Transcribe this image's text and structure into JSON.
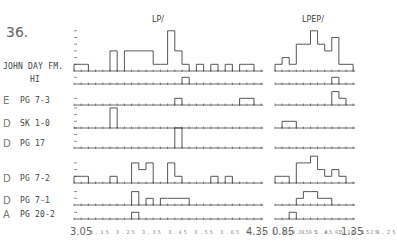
{
  "figure_number": "36.",
  "chart_data": {
    "type": "bar",
    "title": "",
    "panels": [
      {
        "name": "LP/",
        "xlabel": "LP/",
        "bin_start": 3.05,
        "bin_width": 0.05,
        "bins": 26,
        "tick_labels": [
          "3.05",
          "3.15",
          "3.25",
          "3.35",
          "3.45",
          "3.55",
          "3.65",
          "3.75",
          "3.85",
          "3.95",
          "4.05",
          "4.15",
          "4.25",
          "4.35"
        ],
        "xlim": [
          3.05,
          4.35
        ]
      },
      {
        "name": "LPEP/",
        "xlabel": "LPEP/",
        "bin_start": 0.85,
        "bin_width": 0.05,
        "bins": 11,
        "tick_labels": [
          "0.85",
          "0.95",
          "1.05",
          "1.15",
          "1.25",
          "1.35"
        ],
        "xlim": [
          0.85,
          1.35
        ]
      }
    ],
    "series": [
      {
        "group": "",
        "name": "JOHN DAY FM.",
        "LP": [
          1,
          1,
          0,
          0,
          0,
          3,
          0,
          3,
          3,
          3,
          3,
          1,
          1,
          6,
          3,
          1,
          0,
          1,
          0,
          1,
          0,
          1,
          0,
          1,
          1,
          0
        ],
        "LPEP": [
          1,
          2,
          1,
          4,
          4,
          6,
          4,
          3,
          5,
          1,
          1
        ]
      },
      {
        "group": "",
        "name": "HI",
        "LP": [
          0,
          0,
          0,
          0,
          0,
          0,
          0,
          0,
          0,
          0,
          0,
          0,
          0,
          0,
          0,
          1,
          0,
          0,
          0,
          0,
          0,
          0,
          0,
          0,
          0,
          0
        ],
        "LPEP": [
          0,
          0,
          0,
          0,
          0,
          0,
          0,
          0,
          1,
          0,
          0
        ]
      },
      {
        "group": "E",
        "name": "PG 7-3",
        "LP": [
          0,
          0,
          0,
          0,
          0,
          0,
          0,
          0,
          0,
          0,
          0,
          0,
          0,
          0,
          1,
          0,
          0,
          0,
          0,
          0,
          0,
          0,
          0,
          1,
          1,
          0
        ],
        "LPEP": [
          0,
          0,
          0,
          0,
          0,
          0,
          0,
          0,
          2,
          1,
          0
        ]
      },
      {
        "group": "D",
        "name": "SK 1-0",
        "LP": [
          0,
          0,
          0,
          0,
          0,
          3,
          0,
          0,
          0,
          0,
          0,
          0,
          0,
          0,
          0,
          0,
          0,
          0,
          0,
          0,
          0,
          0,
          0,
          0,
          0,
          0
        ],
        "LPEP": [
          0,
          1,
          1,
          0,
          0,
          0,
          0,
          0,
          0,
          0,
          0
        ]
      },
      {
        "group": "D",
        "name": "PG 17",
        "LP": [
          0,
          0,
          0,
          0,
          0,
          0,
          0,
          0,
          0,
          0,
          0,
          0,
          0,
          0,
          3,
          0,
          0,
          0,
          0,
          0,
          0,
          0,
          0,
          0,
          0,
          0
        ],
        "LPEP": [
          0,
          0,
          0,
          0,
          0,
          0,
          0,
          0,
          0,
          0,
          0
        ]
      },
      {
        "group": "D",
        "name": "PG 7-2",
        "LP": [
          1,
          1,
          0,
          0,
          0,
          1,
          0,
          0,
          3,
          2,
          3,
          0,
          0,
          3,
          1,
          0,
          0,
          0,
          0,
          1,
          0,
          1,
          0,
          0,
          0,
          0
        ],
        "LPEP": [
          1,
          1,
          0,
          3,
          3,
          4,
          2,
          1,
          2,
          1,
          0
        ]
      },
      {
        "group": "D",
        "name": "PG 7-1",
        "LP": [
          0,
          0,
          0,
          0,
          0,
          0,
          0,
          0,
          2,
          0,
          1,
          0,
          1,
          1,
          1,
          1,
          0,
          0,
          0,
          0,
          0,
          0,
          0,
          0,
          0,
          0
        ],
        "LPEP": [
          0,
          0,
          0,
          1,
          2,
          2,
          1,
          1,
          0,
          0,
          0
        ]
      },
      {
        "group": "A",
        "name": "PG 20-2",
        "LP": [
          0,
          0,
          0,
          0,
          0,
          0,
          0,
          0,
          1,
          0,
          0,
          0,
          0,
          0,
          0,
          0,
          0,
          0,
          0,
          0,
          0,
          0,
          0,
          0,
          0,
          0
        ],
        "LPEP": [
          0,
          0,
          1,
          0,
          0,
          0,
          0,
          0,
          0,
          0,
          0
        ]
      }
    ],
    "grid": false,
    "legend": "none"
  },
  "labels": {
    "fig": "36.",
    "lp_title": "LP/",
    "lpep_title": "LPEP/",
    "rows": [
      {
        "group": "",
        "name": "JOHN DAY FM."
      },
      {
        "group": "",
        "name": "HI"
      },
      {
        "group": "E",
        "name": "PG 7-3"
      },
      {
        "group": "D",
        "name": "SK 1-0"
      },
      {
        "group": "D",
        "name": "PG 17"
      },
      {
        "group": "D",
        "name": "PG 7-2"
      },
      {
        "group": "D",
        "name": "PG 7-1"
      },
      {
        "group": "A",
        "name": "PG 20-2"
      }
    ],
    "lp_axis_first": "3.05",
    "lp_axis_last": "4.35",
    "lpep_axis_first": "0.85",
    "lpep_axis_last": "1.35",
    "lp_ticks_small": "3.15 3.25 3.35 3.45 3.55 3.65 3.75 3.85 3.95 4.05 4.15 4.25",
    "lpep_ticks_small": "0.95 1.05 1.15 1.25"
  }
}
